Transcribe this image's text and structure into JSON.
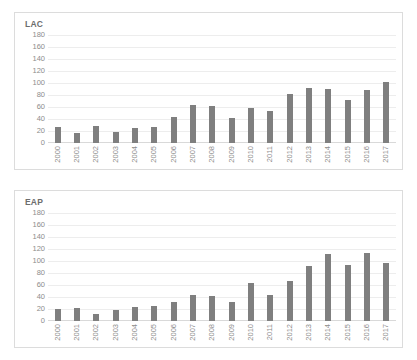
{
  "page": {
    "background_color": "#ffffff",
    "bar_color": "#7f7f7f",
    "grid_color": "#ededed",
    "panel_border_color": "#dcdcdc",
    "text_color": "#8c8c8c"
  },
  "charts": [
    {
      "id": "lac",
      "title": "LAC",
      "y_ticks": [
        "180",
        "160",
        "140",
        "120",
        "100",
        "80",
        "60",
        "40",
        "20",
        "0"
      ],
      "x_labels": [
        "2000",
        "2001",
        "2002",
        "2003",
        "2004",
        "2005",
        "2006",
        "2007",
        "2008",
        "2009",
        "2010",
        "2011",
        "2012",
        "2013",
        "2014",
        "2015",
        "2016",
        "2017"
      ]
    },
    {
      "id": "eap",
      "title": "EAP",
      "y_ticks": [
        "180",
        "160",
        "140",
        "120",
        "100",
        "80",
        "60",
        "40",
        "20",
        "0"
      ],
      "x_labels": [
        "2000",
        "2001",
        "2002",
        "2003",
        "2004",
        "2005",
        "2006",
        "2007",
        "2008",
        "2009",
        "2010",
        "2011",
        "2012",
        "2013",
        "2014",
        "2015",
        "2016",
        "2017"
      ]
    }
  ],
  "chart_data": [
    {
      "type": "bar",
      "title": "LAC",
      "xlabel": "",
      "ylabel": "",
      "ylim": [
        0,
        180
      ],
      "ytick_step": 20,
      "grid": true,
      "legend": false,
      "bar_color": "#7f7f7f",
      "categories": [
        "2000",
        "2001",
        "2002",
        "2003",
        "2004",
        "2005",
        "2006",
        "2007",
        "2008",
        "2009",
        "2010",
        "2011",
        "2012",
        "2013",
        "2014",
        "2015",
        "2016",
        "2017"
      ],
      "values": [
        27,
        16,
        29,
        19,
        25,
        27,
        43,
        64,
        62,
        42,
        59,
        54,
        82,
        91,
        90,
        72,
        88,
        101
      ]
    },
    {
      "type": "bar",
      "title": "EAP",
      "xlabel": "",
      "ylabel": "",
      "ylim": [
        0,
        180
      ],
      "ytick_step": 20,
      "grid": true,
      "legend": false,
      "bar_color": "#7f7f7f",
      "categories": [
        "2000",
        "2001",
        "2002",
        "2003",
        "2004",
        "2005",
        "2006",
        "2007",
        "2008",
        "2009",
        "2010",
        "2011",
        "2012",
        "2013",
        "2014",
        "2015",
        "2016",
        "2017"
      ],
      "values": [
        20,
        22,
        11,
        18,
        24,
        25,
        31,
        44,
        42,
        32,
        64,
        44,
        66,
        91,
        112,
        94,
        113,
        96
      ]
    }
  ]
}
